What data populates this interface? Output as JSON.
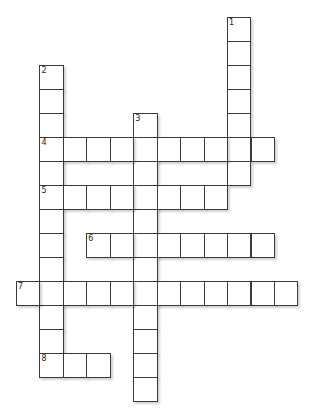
{
  "puzzle": {
    "type": "crossword",
    "grid": {
      "origin_x": 16,
      "origin_y": 17,
      "cell_width": 23.45,
      "cell_height": 24,
      "border_color": "#3a3a3a",
      "cell_color": "#ffffff"
    },
    "words": [
      {
        "number": "1",
        "direction": "down",
        "row": 0,
        "col": 9,
        "length": 7
      },
      {
        "number": "2",
        "direction": "down",
        "row": 2,
        "col": 1,
        "length": 13
      },
      {
        "number": "3",
        "direction": "down",
        "row": 4,
        "col": 5,
        "length": 12
      },
      {
        "number": "4",
        "direction": "across",
        "row": 5,
        "col": 1,
        "length": 10
      },
      {
        "number": "5",
        "direction": "across",
        "row": 7,
        "col": 1,
        "length": 8
      },
      {
        "number": "6",
        "direction": "across",
        "row": 9,
        "col": 3,
        "length": 8
      },
      {
        "number": "7",
        "direction": "across",
        "row": 11,
        "col": 0,
        "length": 12
      },
      {
        "number": "8",
        "direction": "across",
        "row": 14,
        "col": 1,
        "length": 3
      }
    ]
  }
}
